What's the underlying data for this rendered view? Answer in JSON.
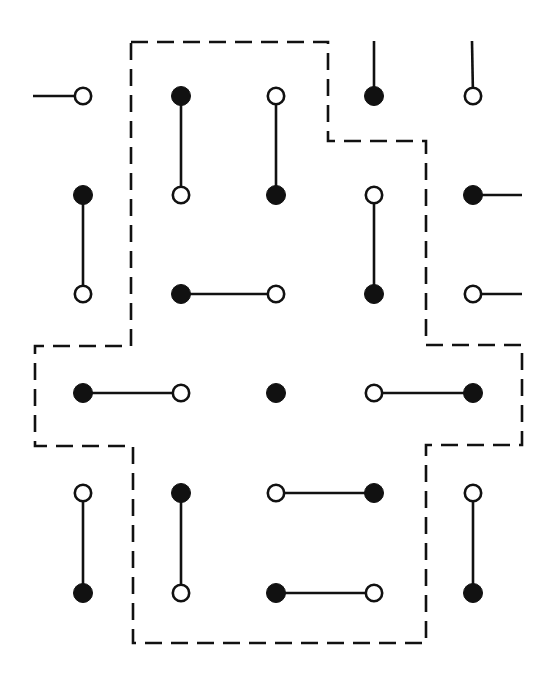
{
  "diagram": {
    "type": "dimer-lattice",
    "colors": {
      "ink": "#111111",
      "filled_site": "#111111",
      "open_site_fill": "#ffffff",
      "background": "#ffffff"
    },
    "grid": {
      "columns_x": [
        83,
        181,
        276,
        374,
        473
      ],
      "rows_y": [
        96,
        195,
        294,
        393,
        493,
        593
      ],
      "site_radius": 9
    },
    "sites": [
      {
        "row": 0,
        "col": 0,
        "kind": "open"
      },
      {
        "row": 0,
        "col": 1,
        "kind": "filled"
      },
      {
        "row": 0,
        "col": 2,
        "kind": "open"
      },
      {
        "row": 0,
        "col": 3,
        "kind": "filled"
      },
      {
        "row": 0,
        "col": 4,
        "kind": "open"
      },
      {
        "row": 1,
        "col": 0,
        "kind": "filled"
      },
      {
        "row": 1,
        "col": 1,
        "kind": "open"
      },
      {
        "row": 1,
        "col": 2,
        "kind": "filled"
      },
      {
        "row": 1,
        "col": 3,
        "kind": "open"
      },
      {
        "row": 1,
        "col": 4,
        "kind": "filled"
      },
      {
        "row": 2,
        "col": 0,
        "kind": "open"
      },
      {
        "row": 2,
        "col": 1,
        "kind": "filled"
      },
      {
        "row": 2,
        "col": 2,
        "kind": "open"
      },
      {
        "row": 2,
        "col": 3,
        "kind": "filled"
      },
      {
        "row": 2,
        "col": 4,
        "kind": "open"
      },
      {
        "row": 3,
        "col": 0,
        "kind": "filled"
      },
      {
        "row": 3,
        "col": 1,
        "kind": "open"
      },
      {
        "row": 3,
        "col": 2,
        "kind": "filled"
      },
      {
        "row": 3,
        "col": 3,
        "kind": "open"
      },
      {
        "row": 3,
        "col": 4,
        "kind": "filled"
      },
      {
        "row": 4,
        "col": 0,
        "kind": "open"
      },
      {
        "row": 4,
        "col": 1,
        "kind": "filled"
      },
      {
        "row": 4,
        "col": 2,
        "kind": "open"
      },
      {
        "row": 4,
        "col": 3,
        "kind": "filled"
      },
      {
        "row": 4,
        "col": 4,
        "kind": "open"
      },
      {
        "row": 5,
        "col": 0,
        "kind": "filled"
      },
      {
        "row": 5,
        "col": 1,
        "kind": "open"
      },
      {
        "row": 5,
        "col": 2,
        "kind": "filled"
      },
      {
        "row": 5,
        "col": 3,
        "kind": "open"
      },
      {
        "row": 5,
        "col": 4,
        "kind": "filled"
      }
    ],
    "bonds": [
      {
        "from": [
          0,
          1
        ],
        "to": [
          1,
          1
        ]
      },
      {
        "from": [
          0,
          2
        ],
        "to": [
          1,
          2
        ]
      },
      {
        "from": [
          1,
          0
        ],
        "to": [
          2,
          0
        ]
      },
      {
        "from": [
          1,
          3
        ],
        "to": [
          2,
          3
        ]
      },
      {
        "from": [
          2,
          1
        ],
        "to": [
          2,
          2
        ]
      },
      {
        "from": [
          3,
          0
        ],
        "to": [
          3,
          1
        ]
      },
      {
        "from": [
          3,
          3
        ],
        "to": [
          3,
          4
        ]
      },
      {
        "from": [
          4,
          0
        ],
        "to": [
          5,
          0
        ]
      },
      {
        "from": [
          4,
          1
        ],
        "to": [
          5,
          1
        ]
      },
      {
        "from": [
          4,
          2
        ],
        "to": [
          4,
          3
        ]
      },
      {
        "from": [
          4,
          4
        ],
        "to": [
          5,
          4
        ]
      },
      {
        "from": [
          5,
          2
        ],
        "to": [
          5,
          3
        ]
      }
    ],
    "stubs": [
      {
        "site": [
          0,
          0
        ],
        "direction": "left",
        "end": [
          33,
          96
        ]
      },
      {
        "site": [
          0,
          3
        ],
        "direction": "up",
        "end": [
          374,
          41
        ]
      },
      {
        "site": [
          0,
          4
        ],
        "direction": "up",
        "end": [
          472,
          41
        ]
      },
      {
        "site": [
          1,
          4
        ],
        "direction": "right",
        "end": [
          522,
          195
        ]
      },
      {
        "site": [
          2,
          4
        ],
        "direction": "right",
        "end": [
          522,
          294
        ]
      }
    ],
    "unpaired_site": {
      "row": 3,
      "col": 2
    },
    "boundary": {
      "style": "dashed",
      "points": [
        [
          131,
          42
        ],
        [
          328,
          42
        ],
        [
          328,
          141
        ],
        [
          426,
          141
        ],
        [
          426,
          345
        ],
        [
          522,
          345
        ],
        [
          522,
          445
        ],
        [
          426,
          445
        ],
        [
          426,
          643
        ],
        [
          133,
          643
        ],
        [
          133,
          446
        ],
        [
          35,
          446
        ],
        [
          35,
          346
        ],
        [
          131,
          346
        ]
      ]
    }
  }
}
